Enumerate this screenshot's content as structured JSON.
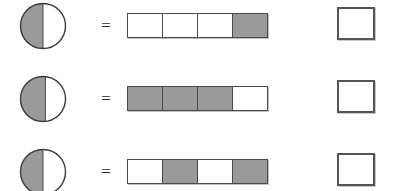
{
  "worksheet": {
    "title": "Equivalent fractions: circle model equals bar model",
    "colors": {
      "shade": "#9a9a9a",
      "outline": "#4a4a4a",
      "box_outline": "#555555",
      "background": "#ffffff"
    },
    "equals_symbol": "=",
    "rows": [
      {
        "circle": {
          "shaded_fraction": 0.5,
          "shaded_side": "left",
          "label": "one half shaded circle"
        },
        "bar": {
          "total_cells": 4,
          "shaded_cells": 1,
          "cells": [
            "white",
            "white",
            "white",
            "shaded"
          ]
        },
        "answer_box": {
          "value": "",
          "placeholder": ""
        }
      },
      {
        "circle": {
          "shaded_fraction": 0.55,
          "shaded_side": "left",
          "label": "just over one half shaded circle"
        },
        "bar": {
          "total_cells": 4,
          "shaded_cells": 3,
          "cells": [
            "shaded",
            "shaded",
            "shaded",
            "white"
          ]
        },
        "answer_box": {
          "value": "",
          "placeholder": ""
        }
      },
      {
        "circle": {
          "shaded_fraction": 0.5,
          "shaded_side": "left",
          "label": "one half shaded circle"
        },
        "bar": {
          "total_cells": 4,
          "shaded_cells": 2,
          "cells": [
            "white",
            "shaded",
            "white",
            "shaded"
          ]
        },
        "answer_box": {
          "value": "",
          "placeholder": ""
        }
      }
    ]
  }
}
